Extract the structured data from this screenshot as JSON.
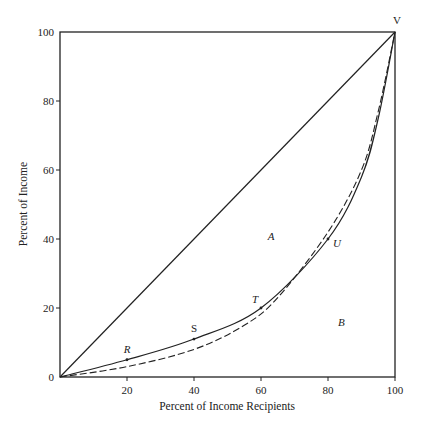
{
  "chart_data": {
    "type": "line",
    "title": "",
    "xlabel": "Percent of Income Recipients",
    "ylabel": "Percent of Income",
    "xlim": [
      0,
      100
    ],
    "ylim": [
      0,
      100
    ],
    "grid": false,
    "x_ticks": [
      0,
      20,
      40,
      60,
      80,
      100
    ],
    "y_ticks": [
      0,
      20,
      40,
      60,
      80,
      100
    ],
    "x_tick_labels": [
      "20",
      "40",
      "60",
      "80",
      "100"
    ],
    "y_tick_labels": [
      "0",
      "20",
      "40",
      "60",
      "80",
      "100"
    ],
    "series": [
      {
        "name": "Line of equality",
        "style": "solid",
        "x": [
          0,
          100
        ],
        "y": [
          0,
          100
        ]
      },
      {
        "name": "Lorenz curve (solid)",
        "style": "solid",
        "x": [
          0,
          20,
          40,
          60,
          80,
          90,
          95,
          100
        ],
        "y": [
          0,
          5,
          11,
          20,
          40,
          58,
          75,
          100
        ]
      },
      {
        "name": "Lorenz curve (dashed)",
        "style": "dashed",
        "x": [
          0,
          20,
          40,
          55,
          65,
          80,
          90,
          95,
          100
        ],
        "y": [
          0,
          3,
          8,
          15,
          23,
          42,
          60,
          77,
          100
        ]
      }
    ],
    "points": [
      {
        "label": "R",
        "x": 20,
        "y": 5
      },
      {
        "label": "S",
        "x": 40,
        "y": 11
      },
      {
        "label": "T",
        "x": 60,
        "y": 20
      },
      {
        "label": "U",
        "x": 80,
        "y": 40
      },
      {
        "label": "V",
        "x": 100,
        "y": 100
      }
    ],
    "annotations": [
      {
        "text": "A",
        "x": 63,
        "y": 41
      },
      {
        "text": "B",
        "x": 84,
        "y": 16
      }
    ]
  }
}
